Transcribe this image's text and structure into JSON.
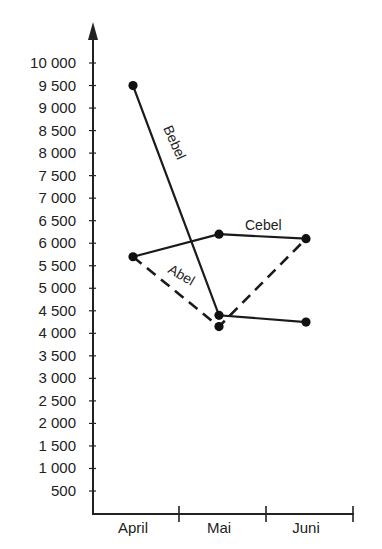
{
  "chart_data": {
    "type": "line",
    "title": "",
    "xlabel": "",
    "ylabel": "",
    "categories": [
      "April",
      "Mai",
      "Juni"
    ],
    "yticks": [
      500,
      1000,
      1500,
      2000,
      2500,
      3000,
      3500,
      4000,
      4500,
      5000,
      5500,
      6000,
      6500,
      7000,
      7500,
      8000,
      8500,
      9000,
      9500,
      10000
    ],
    "ytick_labels": [
      "500",
      "1 000",
      "1 500",
      "2 000",
      "2 500",
      "3 000",
      "3 500",
      "4 000",
      "4 500",
      "5 000",
      "5 500",
      "6 000",
      "6 500",
      "7 000",
      "7 500",
      "8 000",
      "8 500",
      "9 000",
      "9 500",
      "10 000"
    ],
    "ylim": [
      0,
      10500
    ],
    "grid": false,
    "legend": "inline labels",
    "series": [
      {
        "name": "Abel",
        "values": [
          5700,
          4150,
          6100
        ],
        "style": "dashed"
      },
      {
        "name": "Bebel",
        "values": [
          9500,
          4400,
          4250
        ],
        "style": "solid"
      },
      {
        "name": "Cebel",
        "values": [
          5700,
          6200,
          6100
        ],
        "style": "solid"
      }
    ]
  },
  "labels": {
    "abel": "Abel",
    "bebel": "Bebel",
    "cebel": "Cebel",
    "april": "April",
    "mai": "Mai",
    "juni": "Juni"
  }
}
